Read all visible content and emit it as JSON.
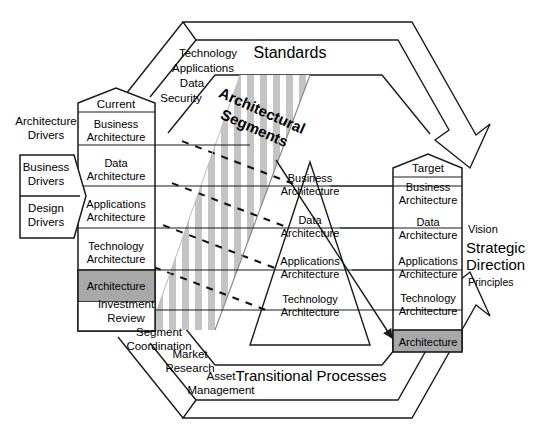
{
  "diagram": {
    "title_standards": "Standards",
    "title_transitional": "Transitional Processes",
    "title_segments_line1": "Architectural",
    "title_segments_line2": "Segments",
    "colors": {
      "line": "#1a1a1a",
      "stripe": "#c4c4c4",
      "gray_cell": "#a8a8a8",
      "background": "#ffffff"
    }
  },
  "drivers": {
    "heading_line1": "Architecture",
    "heading_line2": "Drivers",
    "items": [
      {
        "line1": "Business",
        "line2": "Drivers"
      },
      {
        "line1": "Design",
        "line2": "Drivers"
      }
    ]
  },
  "current_column": {
    "header": "Current",
    "rows": [
      {
        "line1": "Business",
        "line2": "Architecture"
      },
      {
        "line1": "Data",
        "line2": "Architecture"
      },
      {
        "line1": "Applications",
        "line2": "Architecture"
      },
      {
        "line1": "Technology",
        "line2": "Architecture"
      }
    ],
    "footer": "Architecture"
  },
  "middle_column": {
    "rows": [
      {
        "line1": "Business",
        "line2": "Architecture"
      },
      {
        "line1": "Data",
        "line2": "Architecture"
      },
      {
        "line1": "Applications",
        "line2": "Architecture"
      },
      {
        "line1": "Technology",
        "line2": "Architecture"
      }
    ]
  },
  "target_column": {
    "header": "Target",
    "rows": [
      {
        "line1": "Business",
        "line2": "Architecture"
      },
      {
        "line1": "Data",
        "line2": "Architecture"
      },
      {
        "line1": "Applications",
        "line2": "Architecture"
      },
      {
        "line1": "Technology",
        "line2": "Architecture"
      }
    ],
    "footer": "Architecture"
  },
  "standards_list": [
    "Technology",
    "Applications",
    "Data",
    "Security"
  ],
  "processes_list": [
    {
      "line1": "Investment",
      "line2": "Review"
    },
    {
      "line1": "Segment",
      "line2": "Coordination"
    },
    {
      "line1": "Market",
      "line2": "Research"
    },
    {
      "line1": "Asset",
      "line2": "Management"
    }
  ],
  "strategy_panel": {
    "vision": "Vision",
    "strategic_line1": "Strategic",
    "strategic_line2": "Direction",
    "principles": "Principles"
  }
}
